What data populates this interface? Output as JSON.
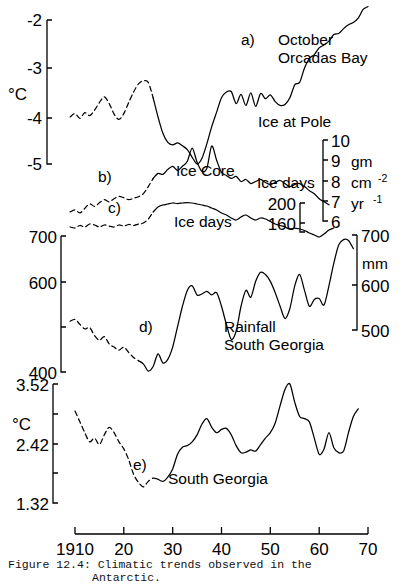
{
  "figure": {
    "caption_line1": "Figure 12.4: Climatic trends observed in the",
    "caption_line2": "Antarctic."
  },
  "xaxis": {
    "ticks": [
      "1910",
      "20",
      "30",
      "40",
      "50",
      "60",
      "70"
    ],
    "values": [
      1910,
      1920,
      1930,
      1940,
      1950,
      1960,
      1970
    ]
  },
  "panels": {
    "a": {
      "key": "a)",
      "label_line1": "October",
      "label_line2": "Orcadas Bay",
      "unit": "°C",
      "ticks": [
        "-2",
        "-3",
        "-4",
        "-5"
      ]
    },
    "b": {
      "key": "b)",
      "label": "Ice Core",
      "axis_title": "Ice at Pole",
      "unit_line1": "gm",
      "unit_line2": "cm",
      "unit_line2_sup": "-2",
      "unit_line3": "yr",
      "unit_line3_sup": "-1",
      "ticks": [
        "10",
        "9",
        "8",
        "7",
        "6"
      ]
    },
    "c": {
      "key": "c)",
      "label": "Ice days",
      "axis_title": "Ice days",
      "ticks": [
        "200",
        "160"
      ]
    },
    "d": {
      "key": "d)",
      "label_line1": "Rainfall",
      "label_line2": "South Georgia",
      "unit": "mm",
      "ticks_left": [
        "700",
        "600",
        "400"
      ],
      "ticks_right": [
        "700",
        "600",
        "500"
      ]
    },
    "e": {
      "key": "e)",
      "label": "South Georgia",
      "unit": "°C",
      "ticks": [
        "3.52",
        "2.42",
        "1.32"
      ]
    }
  },
  "chart_data": {
    "type": "line",
    "title": "Climatic trends observed in the Antarctic",
    "xlabel": "Year",
    "xlim": [
      1908,
      1972
    ],
    "grid": false,
    "legend": "inline-annotations",
    "series": [
      {
        "name": "a) October Orcadas Bay",
        "ylabel": "°C",
        "ylim": [
          -5.2,
          -1.6
        ],
        "yticks": [
          -2,
          -3,
          -4,
          -5
        ],
        "dashed_until": 1925,
        "x": [
          1909,
          1910,
          1911,
          1912,
          1913,
          1914,
          1915,
          1916,
          1917,
          1918,
          1919,
          1920,
          1921,
          1922,
          1923,
          1924,
          1925,
          1926,
          1927,
          1928,
          1929,
          1930,
          1931,
          1932,
          1933,
          1934,
          1935,
          1936,
          1937,
          1938,
          1939,
          1940,
          1941,
          1942,
          1943,
          1944,
          1945,
          1946,
          1947,
          1948,
          1949,
          1950,
          1951,
          1952,
          1953,
          1954,
          1955,
          1956,
          1957,
          1958,
          1959,
          1960,
          1961,
          1962,
          1963,
          1964,
          1965,
          1966,
          1967,
          1968,
          1969,
          1970
        ],
        "y": [
          -4.02,
          -3.95,
          -4.05,
          -3.93,
          -3.99,
          -3.88,
          -3.72,
          -3.6,
          -3.74,
          -3.96,
          -4.07,
          -3.95,
          -3.72,
          -3.5,
          -3.33,
          -3.27,
          -3.3,
          -3.62,
          -4.02,
          -4.36,
          -4.55,
          -4.6,
          -4.56,
          -4.62,
          -4.7,
          -4.86,
          -5.0,
          -4.88,
          -4.58,
          -4.22,
          -3.92,
          -3.62,
          -3.5,
          -3.49,
          -3.74,
          -3.55,
          -3.78,
          -3.52,
          -3.8,
          -3.53,
          -3.64,
          -3.56,
          -3.7,
          -3.78,
          -3.76,
          -3.62,
          -3.35,
          -3.3,
          -3.0,
          -2.8,
          -2.72,
          -2.58,
          -2.52,
          -2.44,
          -2.3,
          -2.28,
          -2.18,
          -2.1,
          -2.05,
          -1.96,
          -1.78,
          -1.72
        ]
      },
      {
        "name": "b) Ice Core (Ice at Pole)",
        "ylabel": "gm cm-2 yr-1",
        "ylim": [
          5.4,
          10.6
        ],
        "yticks": [
          10,
          9,
          8,
          7,
          6
        ],
        "dashed_until": 1925,
        "x": [
          1909,
          1910,
          1911,
          1912,
          1913,
          1914,
          1915,
          1916,
          1917,
          1918,
          1919,
          1920,
          1921,
          1922,
          1923,
          1924,
          1925,
          1926,
          1927,
          1928,
          1929,
          1930,
          1931,
          1932,
          1933,
          1934,
          1935,
          1936,
          1937,
          1938,
          1939,
          1940,
          1941,
          1942,
          1943,
          1944,
          1945,
          1946,
          1947,
          1948,
          1949,
          1950,
          1951,
          1952,
          1953,
          1954,
          1955,
          1956,
          1957,
          1958,
          1959,
          1960,
          1961,
          1962
        ],
        "y": [
          6.45,
          6.55,
          6.4,
          6.62,
          6.85,
          6.72,
          6.9,
          7.05,
          6.95,
          7.1,
          7.22,
          7.15,
          7.05,
          7.12,
          7.2,
          7.35,
          7.7,
          8.1,
          8.35,
          8.3,
          8.55,
          8.7,
          8.5,
          8.7,
          8.95,
          9.6,
          8.9,
          8.45,
          8.6,
          9.7,
          9.0,
          8.4,
          8.25,
          8.1,
          8.2,
          7.95,
          8.05,
          7.85,
          7.95,
          8.05,
          7.9,
          7.8,
          7.9,
          8.0,
          7.85,
          7.7,
          7.8,
          7.85,
          7.7,
          7.5,
          7.35,
          7.1,
          6.95,
          6.8
        ]
      },
      {
        "name": "c) Ice days",
        "ylabel": "days",
        "ylim": [
          120,
          215
        ],
        "yticks": [
          200,
          160
        ],
        "dashed_until": 1925,
        "x": [
          1909,
          1910,
          1911,
          1912,
          1913,
          1914,
          1915,
          1916,
          1917,
          1918,
          1919,
          1920,
          1921,
          1922,
          1923,
          1924,
          1925,
          1926,
          1927,
          1928,
          1929,
          1930,
          1931,
          1932,
          1933,
          1934,
          1935,
          1936,
          1937,
          1938,
          1939,
          1940,
          1941,
          1942,
          1943,
          1944,
          1945,
          1946,
          1947,
          1948,
          1949,
          1950,
          1951,
          1952,
          1953,
          1954,
          1955,
          1956,
          1957,
          1958,
          1959,
          1960,
          1961,
          1962,
          1963
        ],
        "y": [
          152,
          150,
          155,
          152,
          158,
          156,
          152,
          156,
          154,
          152,
          156,
          154,
          157,
          155,
          158,
          160,
          168,
          182,
          192,
          196,
          198,
          200,
          199,
          200,
          201,
          200,
          198,
          196,
          194,
          190,
          186,
          180,
          176,
          170,
          166,
          172,
          176,
          170,
          166,
          170,
          168,
          163,
          158,
          155,
          152,
          148,
          150,
          148,
          145,
          140,
          136,
          132,
          138,
          146,
          150
        ]
      },
      {
        "name": "d) Rainfall South Georgia",
        "ylabel": "mm",
        "ylim": [
          390,
          710
        ],
        "yticks_left": [
          700,
          600,
          400
        ],
        "yticks_right": [
          700,
          600,
          500
        ],
        "dashed_until": 1922,
        "x": [
          1909,
          1910,
          1911,
          1912,
          1913,
          1914,
          1915,
          1916,
          1917,
          1918,
          1919,
          1920,
          1921,
          1922,
          1923,
          1924,
          1925,
          1926,
          1927,
          1928,
          1929,
          1930,
          1931,
          1932,
          1933,
          1934,
          1935,
          1936,
          1937,
          1938,
          1939,
          1940,
          1941,
          1942,
          1943,
          1944,
          1945,
          1946,
          1947,
          1948,
          1949,
          1950,
          1951,
          1952,
          1953,
          1954,
          1955,
          1956,
          1957,
          1958,
          1959,
          1960,
          1961,
          1962,
          1963,
          1964,
          1965,
          1966,
          1967
        ],
        "y": [
          512,
          516,
          505,
          495,
          498,
          480,
          470,
          478,
          462,
          455,
          448,
          455,
          443,
          432,
          425,
          418,
          402,
          412,
          440,
          420,
          428,
          455,
          500,
          545,
          580,
          590,
          570,
          572,
          578,
          570,
          575,
          545,
          505,
          472,
          490,
          545,
          580,
          565,
          600,
          620,
          615,
          600,
          575,
          545,
          518,
          540,
          590,
          615,
          580,
          545,
          560,
          562,
          548,
          590,
          640,
          680,
          692,
          690,
          672
        ]
      },
      {
        "name": "e) South Georgia temperature",
        "ylabel": "°C",
        "ylim": [
          1.2,
          3.62
        ],
        "yticks": [
          3.52,
          2.42,
          1.32
        ],
        "dashed_until": 1926,
        "x": [
          1910,
          1911,
          1912,
          1913,
          1914,
          1915,
          1916,
          1917,
          1918,
          1919,
          1920,
          1921,
          1922,
          1923,
          1924,
          1925,
          1926,
          1927,
          1928,
          1929,
          1930,
          1931,
          1932,
          1933,
          1934,
          1935,
          1936,
          1937,
          1938,
          1939,
          1940,
          1941,
          1942,
          1943,
          1944,
          1945,
          1946,
          1947,
          1948,
          1949,
          1950,
          1951,
          1952,
          1953,
          1954,
          1955,
          1956,
          1957,
          1958,
          1959,
          1960,
          1961,
          1962,
          1963,
          1964,
          1965,
          1966,
          1967,
          1968
        ],
        "y": [
          3.02,
          2.82,
          2.62,
          2.45,
          2.52,
          2.4,
          2.58,
          2.72,
          2.62,
          2.45,
          2.32,
          2.12,
          1.85,
          1.7,
          1.62,
          1.72,
          1.78,
          1.76,
          1.72,
          1.8,
          1.95,
          2.22,
          2.35,
          2.38,
          2.45,
          2.58,
          2.78,
          2.88,
          2.72,
          2.62,
          2.68,
          2.7,
          2.58,
          2.38,
          2.25,
          2.26,
          2.3,
          2.28,
          2.4,
          2.52,
          2.62,
          2.8,
          3.12,
          3.42,
          3.52,
          3.18,
          2.92,
          2.88,
          2.82,
          2.52,
          2.22,
          2.32,
          2.62,
          2.34,
          2.25,
          2.28,
          2.62,
          2.92,
          3.06
        ]
      }
    ]
  }
}
